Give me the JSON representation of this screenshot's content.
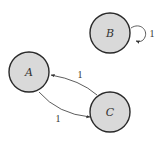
{
  "diagram": {
    "type": "directed-graph",
    "nodes": [
      {
        "id": "A",
        "label": "A"
      },
      {
        "id": "B",
        "label": "B"
      },
      {
        "id": "C",
        "label": "C"
      }
    ],
    "edges": [
      {
        "from": "C",
        "to": "A",
        "label": "1"
      },
      {
        "from": "A",
        "to": "C",
        "label": "1"
      },
      {
        "from": "B",
        "to": "B",
        "label": "1"
      }
    ],
    "colors": {
      "node_fill": "#d9d9d9",
      "node_stroke": "#2a2a2a",
      "edge": "#333333",
      "background": "#ffffff"
    }
  }
}
